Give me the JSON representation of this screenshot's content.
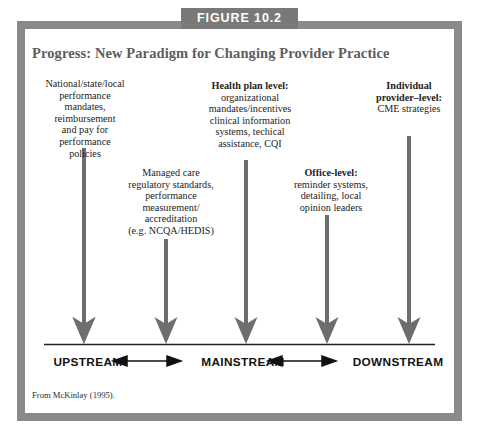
{
  "figure": {
    "number_label": "FIGURE 10.2",
    "title": "Progress: New Paradigm for Changing Provider Practice",
    "source_note": "From McKinlay (1995).",
    "frame_color": "#8a8a8a",
    "tab_color": "#797979",
    "title_color": "#5d5d5d",
    "arrow_color": "#6e6e6e",
    "axis_color": "#222222"
  },
  "columns": [
    {
      "id": "col-1",
      "heading": "",
      "body": "National/state/local performance mandates, reimbursement and pay for performance policies",
      "lines": [
        "National/state/local",
        "performance",
        "mandates,",
        "reimbursement",
        "and pay for",
        "performance",
        "policies"
      ],
      "arrow_x": 84,
      "arrow_top": 148,
      "arrow_tip": 340
    },
    {
      "id": "col-2",
      "heading": "",
      "body": "Managed care regulatory standards, performance measurement/ accreditation (e.g. NCQA/HEDIS)",
      "lines": [
        "Managed care",
        "regulatory standards,",
        "performance",
        "measurement/",
        "accreditation",
        "(e.g. NCQA/HEDIS)"
      ],
      "arrow_x": 166,
      "arrow_top": 239,
      "arrow_tip": 340
    },
    {
      "id": "col-3",
      "heading": "Health plan level:",
      "body": "organizational mandates/incentives clinical information systems, techical assistance, CQI",
      "lines": [
        "organizational",
        "mandates/incentives",
        "clinical information",
        "systems, techical",
        "assistance, CQI"
      ],
      "arrow_x": 246,
      "arrow_top": 160,
      "arrow_tip": 340
    },
    {
      "id": "col-4",
      "heading": "Office-level:",
      "body": "reminder systems, detailing, local opinion leaders",
      "lines": [
        "reminder systems,",
        "detailing, local",
        "opinion leaders"
      ],
      "arrow_x": 327,
      "arrow_top": 215,
      "arrow_tip": 340
    },
    {
      "id": "col-5",
      "heading": "Individual provider–level:",
      "heading_lines": [
        "Individual",
        "provider–level:"
      ],
      "body": "CME strategies",
      "lines": [
        "CME strategies"
      ],
      "arrow_x": 409,
      "arrow_top": 136,
      "arrow_tip": 340
    }
  ],
  "scale": {
    "upstream": "UPSTREAM",
    "mainstream": "MAINSTREAM",
    "downstream": "DOWNSTREAM",
    "axis_line_y": 344
  }
}
